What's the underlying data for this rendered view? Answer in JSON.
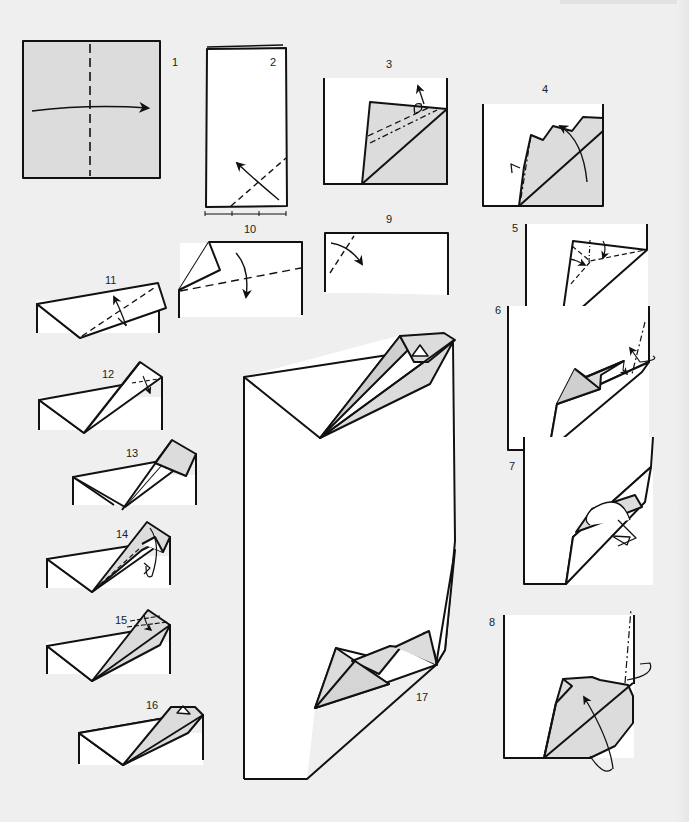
{
  "page": {
    "background": "#efefef",
    "paper_white": "#ffffff",
    "paper_shade": "#dcdcdc",
    "line_color": "#111111"
  },
  "steps": [
    {
      "n": "1",
      "label": "1",
      "lx": 172,
      "ly": 66,
      "desc": "Square, valley-fold in half along vertical dashed line, arrow right"
    },
    {
      "n": "2",
      "label": "2",
      "lx": 270,
      "ly": 66,
      "desc": "Rectangle, valley fold bottom-right corner up, thirds marks below"
    },
    {
      "n": "3",
      "label": "3",
      "lx": 386,
      "ly": 68,
      "desc": "Triangle flap with dash and dash-dot lines, fold behind"
    },
    {
      "n": "4",
      "label": "4",
      "lx": 542,
      "ly": 93,
      "desc": "Fold flap up along diagonal, mountain fold left"
    },
    {
      "n": "5",
      "label": "5",
      "lx": 512,
      "ly": 232,
      "desc": "Squash fold with dashed lines"
    },
    {
      "n": "6",
      "label": "6",
      "lx": 495,
      "ly": 314,
      "desc": "Mountain fold at right edge"
    },
    {
      "n": "7",
      "label": "7",
      "lx": 509,
      "ly": 470,
      "desc": "Wrap-around hollow arrow"
    },
    {
      "n": "8",
      "label": "8",
      "lx": 489,
      "ly": 626,
      "desc": "Swing flap up, mountain fold at edge"
    },
    {
      "n": "9",
      "label": "9",
      "lx": 386,
      "ly": 223,
      "desc": "Rectangle, valley fold top-left corner"
    },
    {
      "n": "10",
      "label": "10",
      "lx": 244,
      "ly": 233,
      "desc": "Valley fold along dashed line, arrow down"
    },
    {
      "n": "11",
      "label": "11",
      "lx": 105,
      "ly": 284,
      "desc": "Fold flap up along dashed diagonal"
    },
    {
      "n": "12",
      "label": "12",
      "lx": 102,
      "ly": 378,
      "desc": "Crimp with crossed dashed lines"
    },
    {
      "n": "13",
      "label": "13",
      "lx": 126,
      "ly": 457,
      "desc": "Shaded flap inside-reverse"
    },
    {
      "n": "14",
      "label": "14",
      "lx": 116,
      "ly": 538,
      "desc": "Rotate flap"
    },
    {
      "n": "15",
      "label": "15",
      "lx": 115,
      "ly": 624,
      "desc": "Pleat at top"
    },
    {
      "n": "16",
      "label": "16",
      "lx": 146,
      "ly": 709,
      "desc": "Finished head detail"
    },
    {
      "n": "17",
      "label": "17",
      "lx": 416,
      "ly": 701,
      "desc": "Large view, both corners complete"
    }
  ]
}
